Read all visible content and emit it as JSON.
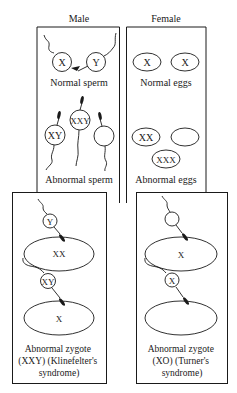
{
  "headers": {
    "male": "Male",
    "female": "Female"
  },
  "male_panel": {
    "normal_sperm": {
      "chromosomes": [
        "X",
        "Y"
      ],
      "label": "Normal sperm"
    },
    "abnormal_sperm": {
      "chromosomes": [
        "XY",
        "XXY",
        ""
      ],
      "label": "Abnormal sperm"
    }
  },
  "female_panel": {
    "normal_eggs": {
      "chromosomes": [
        "X",
        "X"
      ],
      "label": "Normal eggs"
    },
    "abnormal_eggs": {
      "chromosomes": [
        "XX",
        "",
        "XXX"
      ],
      "label": "Abnormal eggs"
    }
  },
  "zygote_left": {
    "sperm1": "Y",
    "egg1": "XX",
    "sperm2": "XY",
    "egg2": "X",
    "caption": [
      "Abnormal zygote",
      "(XXY) (Klinefelter's",
      "syndrome)"
    ]
  },
  "zygote_right": {
    "sperm1": "",
    "egg1": "X",
    "sperm2": "X",
    "egg2": "",
    "caption": [
      "Abnormal zygote",
      "(XO) (Turner's",
      "syndrome)"
    ]
  },
  "colors": {
    "ink": "#1a1a1a",
    "background": "#ffffff"
  }
}
